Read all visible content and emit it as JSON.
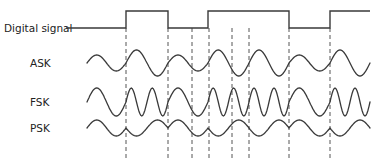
{
  "diagram": {
    "labels": {
      "digital": "Digital signal",
      "ask": "ASK",
      "fsk": "FSK",
      "psk": "PSK"
    },
    "colors": {
      "trace": "#3a3a3a",
      "dash": "#555555",
      "text": "#222222",
      "background": "#ffffff"
    },
    "bits": [
      0,
      1,
      0,
      1,
      1,
      0,
      1
    ],
    "bit_boundaries_x": [
      87,
      126,
      168,
      208,
      249,
      289,
      330,
      370
    ],
    "dashed_lines_x": [
      126,
      168,
      192,
      209,
      232,
      249,
      289,
      330
    ],
    "extra_dashed_x_note": "",
    "layout": {
      "digital_low_y": 28,
      "digital_high_y": 11,
      "digital_lead_start_x": 66,
      "ask_center_y": 63,
      "fsk_center_y": 102,
      "psk_center_y": 128,
      "dash_top_y": 13,
      "dash_bottom_y": 158,
      "wave_start_x": 87,
      "wave_end_x": 370
    },
    "ask": {
      "amp_one": 13,
      "amp_zero": 8,
      "cycles_per_bit": 1
    },
    "fsk": {
      "amp": 14,
      "cycles_one": 2,
      "cycles_zero": 1
    },
    "psk": {
      "amp": 8,
      "cycles_per_bit": 1
    }
  }
}
